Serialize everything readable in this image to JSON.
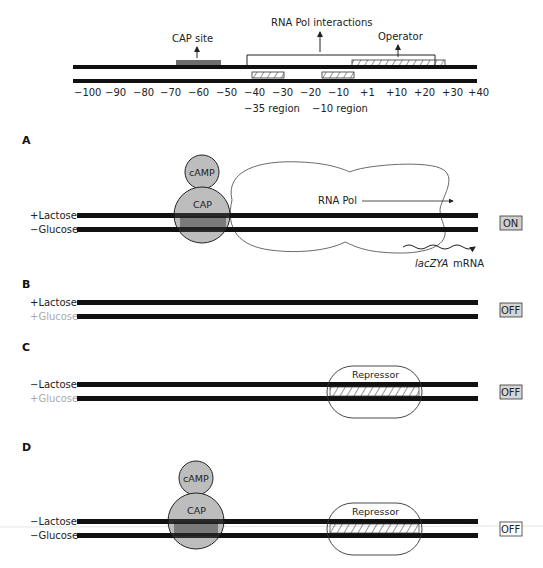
{
  "top": {
    "labels": {
      "cap_site": "CAP site",
      "rna_pol_interactions": "RNA Pol interactions",
      "operator": "Operator",
      "minus35_region": "−35 region",
      "minus10_region": "−10 region"
    },
    "ticks": [
      "−100",
      "−90",
      "−80",
      "−70",
      "−60",
      "−50",
      "−40",
      "−30",
      "−20",
      "−10",
      "+1",
      "+10",
      "+20",
      "+30",
      "+40"
    ]
  },
  "panels": {
    "A": {
      "letter": "A",
      "lactose": "+Lactose",
      "glucose": "−Glucose",
      "camp": "cAMP",
      "cap": "CAP",
      "rna_pol": "RNA Pol",
      "mrna_gene": "lacZYA",
      "mrna": "mRNA",
      "state": "ON"
    },
    "B": {
      "letter": "B",
      "lactose": "+Lactose",
      "glucose": "+Glucose",
      "state": "OFF"
    },
    "C": {
      "letter": "C",
      "lactose": "−Lactose",
      "glucose": "+Glucose",
      "repressor": "Repressor",
      "state": "OFF"
    },
    "D": {
      "letter": "D",
      "lactose": "−Lactose",
      "glucose": "−Glucose",
      "camp": "cAMP",
      "cap": "CAP",
      "repressor": "Repressor",
      "state": "OFF"
    }
  },
  "colors": {
    "dna": "#111111",
    "cap_fill": "#bdbdbd",
    "cap_core": "#7a7a7a",
    "cap_site": "#6e6e6e",
    "state_on_fill": "#d0d0d0",
    "state_off_fill": "#d6d6d6",
    "light_text": "#aaaaaa"
  }
}
